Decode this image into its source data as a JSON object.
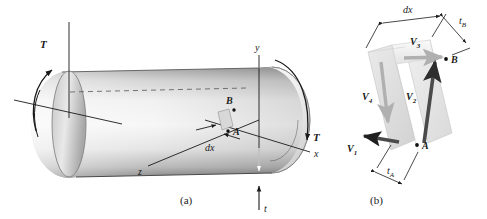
{
  "figure": {
    "panel_a": {
      "caption": "(a)",
      "axes": {
        "x": "x",
        "y": "y",
        "z": "z"
      },
      "torque_left": "T",
      "torque_right": "T",
      "thickness_label": "t",
      "element_length_label": "dx",
      "point_a": "A",
      "point_b": "B"
    },
    "panel_b": {
      "caption": "(b)",
      "dim_dx": "dx",
      "dim_tB": "t",
      "dim_tB_sub": "B",
      "dim_tA": "t",
      "dim_tA_sub": "A",
      "point_a": "A",
      "point_b": "B",
      "forces": [
        {
          "name": "V",
          "sub": "1"
        },
        {
          "name": "V",
          "sub": "2"
        },
        {
          "name": "V",
          "sub": "3"
        },
        {
          "name": "V",
          "sub": "4"
        }
      ]
    }
  },
  "colors": {
    "ink": "#1a1a1a",
    "arrow_dark": "#4a4a4a",
    "arrow_light": "#b8b8b8",
    "tube_light": "#f2f2f2",
    "tube_mid": "#c9c9c9",
    "tube_dark": "#6e6e6e",
    "cavity_dark": "#3a3a3a",
    "element_face": "#e3e3e3"
  }
}
